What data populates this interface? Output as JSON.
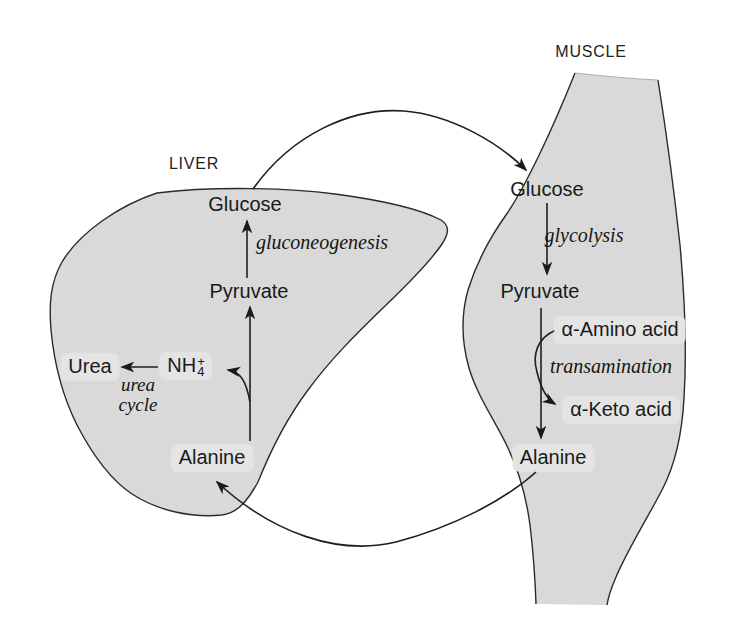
{
  "figure": {
    "liver": {
      "region_label": "LIVER",
      "nodes": {
        "glucose": "Glucose",
        "pyruvate": "Pyruvate",
        "urea": "Urea",
        "ammonium_base": "NH",
        "ammonium_sub": "4",
        "ammonium_sup": "+",
        "alanine": "Alanine"
      },
      "processes": {
        "gluconeogenesis": "gluconeogenesis",
        "urea_cycle_line1": "urea",
        "urea_cycle_line2": "cycle"
      }
    },
    "muscle": {
      "region_label": "MUSCLE",
      "nodes": {
        "glucose": "Glucose",
        "pyruvate": "Pyruvate",
        "amino_acid": "α-Amino acid",
        "keto_acid": "α-Keto acid",
        "alanine": "Alanine"
      },
      "processes": {
        "glycolysis": "glycolysis",
        "transamination": "transamination"
      }
    },
    "colors": {
      "organ_fill": "#d9d9d9",
      "label_box": "#e4e4e4",
      "outline": "#2b2b2b",
      "text": "#1a1a1a",
      "background": "#ffffff"
    }
  }
}
